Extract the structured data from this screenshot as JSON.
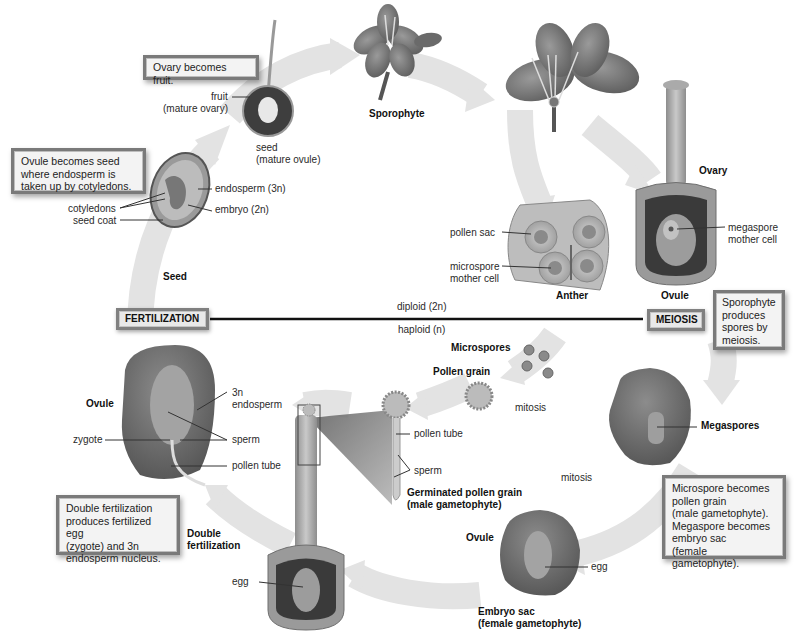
{
  "diagram": {
    "ploidy_line": {
      "left_stage": "FERTILIZATION",
      "right_stage": "MEIOSIS",
      "above": "diploid (2n)",
      "below": "haploid (n)"
    },
    "callouts": {
      "ovary_fruit": "Ovary becomes fruit.",
      "ovule_seed": [
        "Ovule becomes seed",
        "where endosperm is",
        "taken up by cotyledons."
      ],
      "sporophyte_meiosis": [
        "Sporophyte",
        "produces",
        "spores by",
        "meiosis."
      ],
      "micro_mega": [
        "Microspore becomes",
        "pollen grain",
        "(male gametophyte).",
        "Megaspore becomes",
        "embryo sac",
        "(female gametophyte)."
      ],
      "double_fert": [
        "Double fertilization",
        "produces fertilized egg",
        "(zygote) and 3n",
        "endosperm nucleus."
      ]
    },
    "stage_labels": {
      "sporophyte": "Sporophyte",
      "seed": "Seed",
      "ovary": "Ovary",
      "anther": "Anther",
      "ovule_top": "Ovule",
      "microspores": "Microspores",
      "pollen_grain": "Pollen grain",
      "megaspores": "Megaspores",
      "germinated_1": "Germinated pollen grain",
      "germinated_2": "(male gametophyte)",
      "ovule_bottom": "Ovule",
      "embryo_sac_1": "Embryo sac",
      "embryo_sac_2": "(female gametophyte)",
      "double_1": "Double",
      "double_2": "fertilization",
      "ovule_left": "Ovule"
    },
    "part_labels": {
      "fruit_1": "fruit",
      "fruit_2": "(mature ovary)",
      "seed_1": "seed",
      "seed_2": "(mature ovule)",
      "endosperm_3n": "endosperm (3n)",
      "embryo_2n": "embryo (2n)",
      "cotyledons": "cotyledons",
      "seed_coat": "seed coat",
      "pollen_sac": "pollen sac",
      "microspore_mc_1": "microspore",
      "microspore_mc_2": "mother cell",
      "megaspore_mc_1": "megaspore",
      "megaspore_mc_2": "mother cell",
      "mitosis_1": "mitosis",
      "mitosis_2": "mitosis",
      "pollen_tube_right": "pollen tube",
      "sperm_right": "sperm",
      "egg_bottom": "egg",
      "egg_left": "egg",
      "endo_3n_1": "3n",
      "endo_3n_2": "endosperm",
      "sperm_left": "sperm",
      "zygote": "zygote",
      "pollen_tube_left": "pollen tube"
    }
  }
}
